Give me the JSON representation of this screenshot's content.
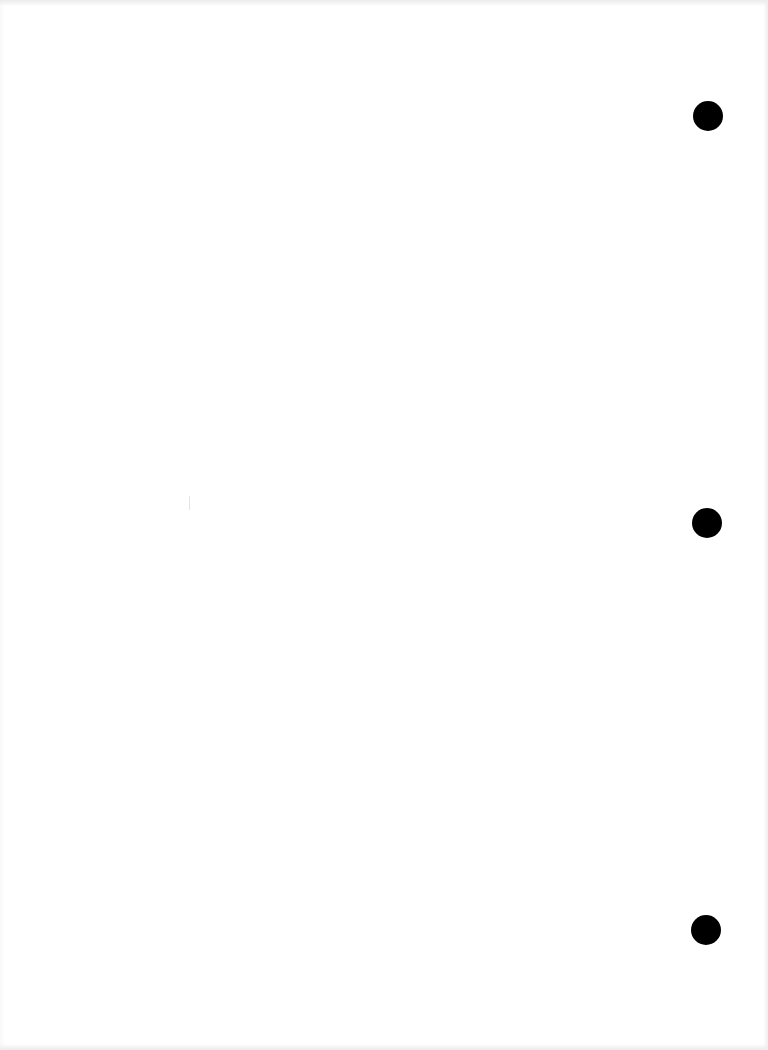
{
  "page": {
    "type": "blank-scanned-page",
    "background_color": "#ffffff",
    "text": ""
  },
  "punch_holes": [
    {
      "name": "top",
      "cx": 708,
      "cy": 116,
      "diameter": 30,
      "color": "#000000"
    },
    {
      "name": "middle",
      "cx": 707,
      "cy": 523,
      "diameter": 30,
      "color": "#000000"
    },
    {
      "name": "bottom",
      "cx": 706,
      "cy": 930,
      "diameter": 30,
      "color": "#000000"
    }
  ]
}
